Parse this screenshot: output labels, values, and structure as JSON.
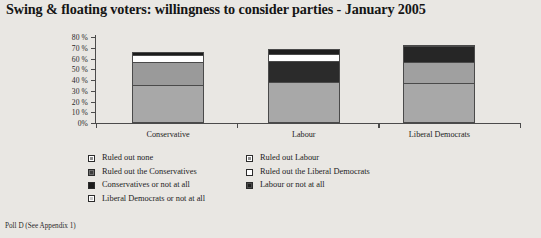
{
  "title": "Swing & floating voters: willingness to consider parties - January 2005",
  "footer": "Poll D (See Appendix 1)",
  "legend": {
    "left": [
      "Ruled out none",
      "Ruled out the Conservatives",
      "Conservatives or not at all",
      "Liberal Democrats or not at all"
    ],
    "right": [
      "Ruled out Labour",
      "Ruled out the Liberal Democrats",
      "Labour or not at all"
    ]
  },
  "colors": {
    "background": "#e9e7e3",
    "axis": "#4b4b4b",
    "ruled_out_none": "#a8a8a8",
    "ruled_out_labour": "#b3b3b3",
    "ruled_out_conservatives": "#9a9a9a",
    "ruled_out_libdems": "#ffffff",
    "conservatives_or_not": "#1c1c1c",
    "labour_or_not": "#3a3a3a",
    "libdems_or_not": "#f2f2f2"
  },
  "chart_data": {
    "type": "bar",
    "subtype": "stacked",
    "title": "Swing & floating voters: willingness to consider parties - January 2005",
    "xlabel": "",
    "ylabel": "",
    "ylim": [
      0,
      80
    ],
    "ytick_labels": [
      "0%",
      "10 %",
      "20 %",
      "30 %",
      "40 %",
      "50 %",
      "60 %",
      "70 %",
      "80 %"
    ],
    "ytick_values": [
      0,
      10,
      20,
      30,
      40,
      50,
      60,
      70,
      80
    ],
    "grid": false,
    "legend_position": "bottom",
    "categories": [
      "Conservative",
      "Labour",
      "Liberal Democrats"
    ],
    "series": [
      {
        "name": "Ruled out none",
        "color": "#a8a8a8",
        "values": [
          35,
          38,
          37
        ]
      },
      {
        "name": "Ruled out the Conservatives",
        "color": "#9a9a9a",
        "values": [
          22,
          0,
          20
        ]
      },
      {
        "name": "Labour or not at all",
        "color": "#3a3a3a",
        "values": [
          0,
          20,
          0
        ]
      },
      {
        "name": "Ruled out the Liberal Democrats",
        "color": "#ffffff",
        "values": [
          6,
          6,
          0
        ]
      },
      {
        "name": "Conservatives or not at all",
        "color": "#1c1c1c",
        "values": [
          3,
          5,
          15
        ]
      },
      {
        "name": "Liberal Democrats or not at all",
        "color": "#f2f2f2",
        "values": [
          0,
          0,
          1
        ]
      }
    ],
    "totals": [
      66,
      69,
      73
    ]
  },
  "bars": [
    {
      "category": "Conservative",
      "center_pct": 17.0,
      "segments": [
        {
          "name": "ruled-out-none",
          "from": 0,
          "to": 35,
          "color": "#a8a8a8"
        },
        {
          "name": "ruled-out-the-conservatives",
          "from": 35,
          "to": 57,
          "color": "#9a9a9a"
        },
        {
          "name": "ruled-out-the-liberal-democrats",
          "from": 57,
          "to": 63,
          "color": "#ffffff"
        },
        {
          "name": "conservatives-or-not-at-all",
          "from": 63,
          "to": 66,
          "color": "#1c1c1c"
        }
      ]
    },
    {
      "category": "Labour",
      "center_pct": 49.0,
      "segments": [
        {
          "name": "ruled-out-labour",
          "from": 0,
          "to": 38,
          "color": "#a8a8a8"
        },
        {
          "name": "labour-or-not-at-all",
          "from": 38,
          "to": 58,
          "color": "#2b2b2b"
        },
        {
          "name": "ruled-out-the-liberal-democrats",
          "from": 58,
          "to": 64,
          "color": "#ffffff"
        },
        {
          "name": "conservatives-or-not-at-all",
          "from": 64,
          "to": 69,
          "color": "#1e1e1e"
        }
      ]
    },
    {
      "category": "Liberal Democrats",
      "center_pct": 81.0,
      "segments": [
        {
          "name": "ruled-out-none",
          "from": 0,
          "to": 37,
          "color": "#a8a8a8"
        },
        {
          "name": "ruled-out-the-conservatives",
          "from": 37,
          "to": 57,
          "color": "#a0a0a0"
        },
        {
          "name": "conservatives-or-not-at-all",
          "from": 57,
          "to": 72,
          "color": "#262626"
        },
        {
          "name": "liberal-democrats-or-not-at-all",
          "from": 72,
          "to": 73,
          "color": "#f2f2f2"
        }
      ]
    }
  ]
}
